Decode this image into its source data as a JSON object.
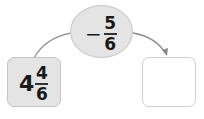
{
  "diagram": {
    "start": {
      "whole": "4",
      "numerator": "4",
      "denominator": "6"
    },
    "operation": {
      "sign": "−",
      "numerator": "5",
      "denominator": "6"
    },
    "result": {
      "value": ""
    }
  }
}
